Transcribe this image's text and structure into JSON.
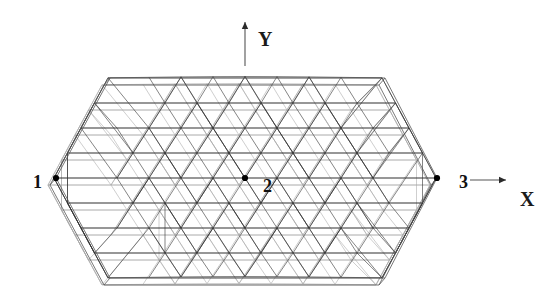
{
  "figure": {
    "background_color": "#ffffff",
    "line_color": "#404040",
    "node_color": "#000000",
    "width": 560,
    "height": 297
  },
  "axes": {
    "x": {
      "label": "X",
      "label_x": 520,
      "label_y": 206,
      "arrow": {
        "x1": 470,
        "y1": 180,
        "x2": 506,
        "y2": 180,
        "direction": "right"
      }
    },
    "y": {
      "label": "Y",
      "label_x": 258,
      "label_y": 46,
      "arrow": {
        "x1": 245,
        "y1": 66,
        "x2": 245,
        "y2": 22,
        "direction": "up"
      }
    }
  },
  "nodes": [
    {
      "id": "1",
      "label": "1",
      "marker_x": 56,
      "marker_y": 178,
      "label_x": 33,
      "label_y": 188
    },
    {
      "id": "2",
      "label": "2",
      "marker_x": 245,
      "marker_y": 178,
      "label_x": 263,
      "label_y": 192
    },
    {
      "id": "3",
      "label": "3",
      "marker_x": 437,
      "marker_y": 178,
      "label_x": 459,
      "label_y": 188
    }
  ],
  "mesh": {
    "type": "hexagonal-triangulated-double-layer-grid",
    "outline_vertices": [
      [
        56,
        178
      ],
      [
        110,
        78
      ],
      [
        385,
        78
      ],
      [
        437,
        178
      ],
      [
        385,
        278
      ],
      [
        110,
        278
      ]
    ],
    "rows": 9,
    "row_spacing": 25,
    "column_spacing": 32,
    "center": [
      245,
      178
    ],
    "top_row_y": 78,
    "bottom_row_y": 278,
    "mid_row_y": 178,
    "half_width_at_mid": 191,
    "second_layer_offset": {
      "dx": -6,
      "dy": 7
    }
  },
  "chart_data": {
    "type": "scatter",
    "title": "",
    "xlabel": "X",
    "ylabel": "Y",
    "annotations": [
      "1",
      "2",
      "3",
      "X",
      "Y"
    ],
    "x": [
      56,
      245,
      437
    ],
    "y": [
      178,
      178,
      178
    ],
    "labels": [
      "1",
      "2",
      "3"
    ]
  }
}
